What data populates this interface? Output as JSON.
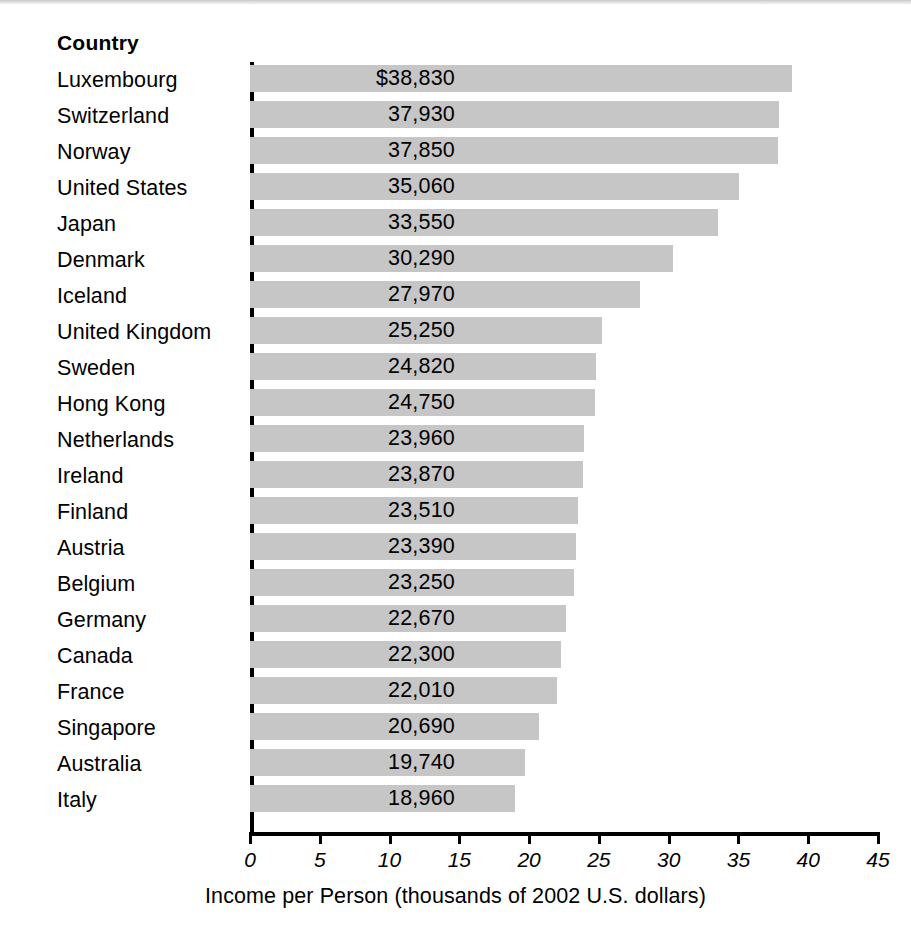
{
  "column_header": "Country",
  "chart_data": {
    "type": "bar",
    "orientation": "horizontal",
    "title": "",
    "xlabel": "Income per Person (thousands of 2002 U.S. dollars)",
    "ylabel": "Country",
    "xlim": [
      0,
      45
    ],
    "xticks": [
      0,
      5,
      10,
      15,
      20,
      25,
      30,
      35,
      40,
      45
    ],
    "xtick_labels": [
      "0",
      "5",
      "10",
      "15",
      "20",
      "25",
      "30",
      "35",
      "40",
      "45"
    ],
    "grid": false,
    "legend": false,
    "bar_color": "#c6c6c6",
    "units": "thousands of 2002 U.S. dollars",
    "categories": [
      "Luxembourg",
      "Switzerland",
      "Norway",
      "United States",
      "Japan",
      "Denmark",
      "Iceland",
      "United Kingdom",
      "Sweden",
      "Hong Kong",
      "Netherlands",
      "Ireland",
      "Finland",
      "Austria",
      "Belgium",
      "Germany",
      "Canada",
      "France",
      "Singapore",
      "Australia",
      "Italy"
    ],
    "values": [
      38.83,
      37.93,
      37.85,
      35.06,
      33.55,
      30.29,
      27.97,
      25.25,
      24.82,
      24.75,
      23.96,
      23.87,
      23.51,
      23.39,
      23.25,
      22.67,
      22.3,
      22.01,
      20.69,
      19.74,
      18.96
    ],
    "value_labels": [
      "$38,830",
      "37,930",
      "37,850",
      "35,060",
      "33,550",
      "30,290",
      "27,970",
      "25,250",
      "24,820",
      "24,750",
      "23,960",
      "23,870",
      "23,510",
      "23,390",
      "23,250",
      "22,670",
      "22,300",
      "22,010",
      "20,690",
      "19,740",
      "18,960"
    ]
  }
}
